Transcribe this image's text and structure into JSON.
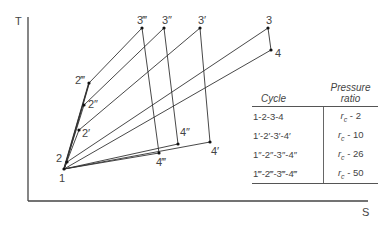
{
  "diagram": {
    "type": "T-S diagram",
    "axes": {
      "y_label": "T",
      "x_label": "S"
    },
    "points": [
      {
        "id": "1",
        "label": "1",
        "x": 64,
        "y": 169
      },
      {
        "id": "2",
        "label": "2",
        "x": 67,
        "y": 162
      },
      {
        "id": "2p",
        "label": "2′",
        "x": 79,
        "y": 130
      },
      {
        "id": "2pp",
        "label": "2″",
        "x": 84,
        "y": 105
      },
      {
        "id": "2ppp",
        "label": "2‴",
        "x": 89,
        "y": 83
      },
      {
        "id": "3",
        "label": "3",
        "x": 268,
        "y": 28
      },
      {
        "id": "3p",
        "label": "3′",
        "x": 200,
        "y": 28
      },
      {
        "id": "3pp",
        "label": "3″",
        "x": 164,
        "y": 28
      },
      {
        "id": "3ppp",
        "label": "3‴",
        "x": 142,
        "y": 28
      },
      {
        "id": "4",
        "label": "4",
        "x": 271,
        "y": 50
      },
      {
        "id": "4p",
        "label": "4′",
        "x": 210,
        "y": 142
      },
      {
        "id": "4pp",
        "label": "4″",
        "x": 178,
        "y": 144
      },
      {
        "id": "4ppp",
        "label": "4‴",
        "x": 159,
        "y": 153
      }
    ],
    "cycles": [
      {
        "name": "1-2-3-4",
        "path": [
          "1",
          "2",
          "3",
          "4",
          "1"
        ]
      },
      {
        "name": "1′-2′-3′-4′",
        "path": [
          "1",
          "2p",
          "3p",
          "4p",
          "1"
        ]
      },
      {
        "name": "1″-2″-3″-4″",
        "path": [
          "1",
          "2pp",
          "3pp",
          "4pp",
          "1"
        ]
      },
      {
        "name": "1‴-2‴-3‴-4‴",
        "path": [
          "1",
          "2ppp",
          "3ppp",
          "4ppp",
          "1"
        ]
      }
    ]
  },
  "table": {
    "headers": {
      "cycle": "Cycle",
      "pressure_line1": "Pressure",
      "pressure_line2": "ratio"
    },
    "rows": [
      {
        "cycle": "1-2-3-4",
        "r_symbol": "r",
        "r_sub": "c",
        "ratio": " - 2"
      },
      {
        "cycle": "1′-2′-3′-4′",
        "r_symbol": "r",
        "r_sub": "c",
        "ratio": " - 10"
      },
      {
        "cycle": "1″-2″-3″-4″",
        "r_symbol": "r",
        "r_sub": "c",
        "ratio": " - 26"
      },
      {
        "cycle": "1‴-2‴-3‴-4‴",
        "r_symbol": "r",
        "r_sub": "c",
        "ratio": " - 50"
      }
    ]
  },
  "colors": {
    "line": "#333333",
    "axis": "#444444",
    "text": "#444444"
  }
}
